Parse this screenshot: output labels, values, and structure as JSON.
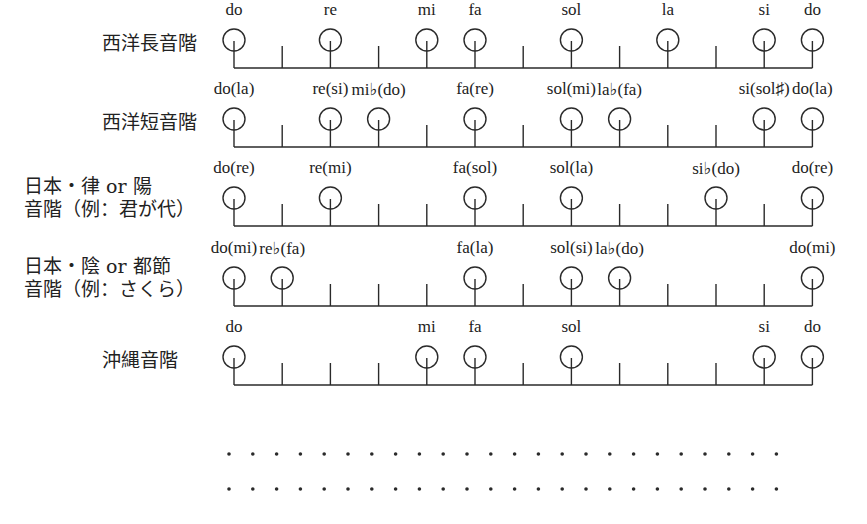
{
  "diagram": {
    "geometry": {
      "x_start": 234,
      "step": 48.2,
      "semitones": 12
    },
    "scales": [
      {
        "name": "西洋長音階",
        "label_lines": [
          "西洋長音階"
        ],
        "baseline_y": 68,
        "notes": [
          {
            "pos": 0,
            "label": "do"
          },
          {
            "pos": 2,
            "label": "re"
          },
          {
            "pos": 4,
            "label": "mi"
          },
          {
            "pos": 5,
            "label": "fa"
          },
          {
            "pos": 7,
            "label": "sol"
          },
          {
            "pos": 9,
            "label": "la"
          },
          {
            "pos": 11,
            "label": "si"
          },
          {
            "pos": 12,
            "label": "do"
          }
        ]
      },
      {
        "name": "西洋短音階",
        "label_lines": [
          "西洋短音階"
        ],
        "baseline_y": 147,
        "notes": [
          {
            "pos": 0,
            "label": "do(la)"
          },
          {
            "pos": 2,
            "label": "re(si)"
          },
          {
            "pos": 3,
            "label": "mi♭(do)"
          },
          {
            "pos": 5,
            "label": "fa(re)"
          },
          {
            "pos": 7,
            "label": "sol(mi)"
          },
          {
            "pos": 8,
            "label": "la♭(fa)"
          },
          {
            "pos": 11,
            "label": "si(sol♯)"
          },
          {
            "pos": 12,
            "label": "do(la)"
          }
        ]
      },
      {
        "name": "日本・律 or 陽音階（例：君が代）",
        "label_lines": [
          "日本・律 or 陽",
          "音階（例：君が代）"
        ],
        "baseline_y": 226,
        "notes": [
          {
            "pos": 0,
            "label": "do(re)"
          },
          {
            "pos": 2,
            "label": "re(mi)"
          },
          {
            "pos": 5,
            "label": "fa(sol)"
          },
          {
            "pos": 7,
            "label": "sol(la)"
          },
          {
            "pos": 10,
            "label": "si♭(do)"
          },
          {
            "pos": 12,
            "label": "do(re)"
          }
        ]
      },
      {
        "name": "日本・陰 or 都節音階（例：さくら）",
        "label_lines": [
          "日本・陰 or 都節",
          "音階（例：さくら）"
        ],
        "baseline_y": 306,
        "notes": [
          {
            "pos": 0,
            "label": "do(mi)"
          },
          {
            "pos": 1,
            "label": "re♭(fa)"
          },
          {
            "pos": 5,
            "label": "fa(la)"
          },
          {
            "pos": 7,
            "label": "sol(si)"
          },
          {
            "pos": 8,
            "label": "la♭(do)"
          },
          {
            "pos": 12,
            "label": "do(mi)"
          }
        ]
      },
      {
        "name": "沖縄音階",
        "label_lines": [
          "沖縄音階"
        ],
        "baseline_y": 385,
        "notes": [
          {
            "pos": 0,
            "label": "do"
          },
          {
            "pos": 4,
            "label": "mi"
          },
          {
            "pos": 5,
            "label": "fa"
          },
          {
            "pos": 7,
            "label": "sol"
          },
          {
            "pos": 11,
            "label": "si"
          },
          {
            "pos": 12,
            "label": "do"
          }
        ]
      }
    ],
    "dot_rows": [
      {
        "y": 454,
        "count": 24,
        "x_start": 229,
        "spacing": 23.8
      },
      {
        "y": 489,
        "count": 24,
        "x_start": 229,
        "spacing": 23.8
      }
    ],
    "colors": {
      "ink": "#2a2a2a",
      "background": "#ffffff"
    }
  }
}
